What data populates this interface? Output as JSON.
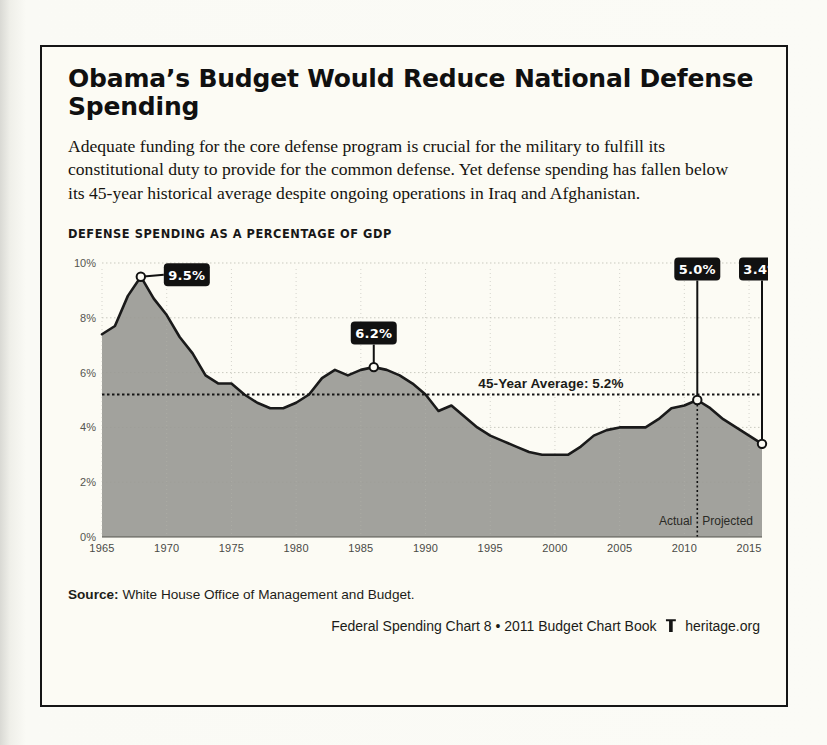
{
  "card": {
    "title": "Obama’s Budget Would Reduce National Defense Spending",
    "blurb": "Adequate funding for the core defense program is crucial for the military to fulfill its constitutional duty to provide for the common defense. Yet defense spending has fallen below its 45-year historical average despite ongoing operations in Iraq and Afghanistan.",
    "source_label": "Source:",
    "source_text": "White House Office of Management and Budget.",
    "footer_left": "Federal Spending Chart 8 • 2011 Budget Chart Book",
    "footer_logo": "heritage-logo-icon",
    "footer_right": "heritage.org"
  },
  "chart_data": {
    "type": "area",
    "title": "DEFENSE SPENDING AS A PERCENTAGE OF GDP",
    "xlabel": "",
    "ylabel": "",
    "xlim": [
      1965,
      2016
    ],
    "ylim": [
      0,
      10
    ],
    "grid": true,
    "legend": null,
    "yticks": [
      0,
      2,
      4,
      6,
      8,
      10
    ],
    "ytick_labels": [
      "0%",
      "2%",
      "4%",
      "6%",
      "8%",
      "10%"
    ],
    "xticks": [
      1965,
      1970,
      1975,
      1980,
      1985,
      1990,
      1995,
      2000,
      2005,
      2010,
      2015
    ],
    "xtick_labels": [
      "1965",
      "1970",
      "1975",
      "1980",
      "1985",
      "1990",
      "1995",
      "2000",
      "2005",
      "2010",
      "2015"
    ],
    "series": [
      {
        "name": "Defense spending as a percentage of GDP",
        "x": [
          1965,
          1966,
          1967,
          1968,
          1969,
          1970,
          1971,
          1972,
          1973,
          1974,
          1975,
          1976,
          1977,
          1978,
          1979,
          1980,
          1981,
          1982,
          1983,
          1984,
          1985,
          1986,
          1987,
          1988,
          1989,
          1990,
          1991,
          1992,
          1993,
          1994,
          1995,
          1996,
          1997,
          1998,
          1999,
          2000,
          2001,
          2002,
          2003,
          2004,
          2005,
          2006,
          2007,
          2008,
          2009,
          2010,
          2011,
          2012,
          2013,
          2014,
          2015,
          2016
        ],
        "values": [
          7.4,
          7.7,
          8.8,
          9.5,
          8.7,
          8.1,
          7.3,
          6.7,
          5.9,
          5.6,
          5.6,
          5.2,
          4.9,
          4.7,
          4.7,
          4.9,
          5.2,
          5.8,
          6.1,
          5.9,
          6.1,
          6.2,
          6.1,
          5.9,
          5.6,
          5.2,
          4.6,
          4.8,
          4.4,
          4.0,
          3.7,
          3.5,
          3.3,
          3.1,
          3.0,
          3.0,
          3.0,
          3.3,
          3.7,
          3.9,
          4.0,
          4.0,
          4.0,
          4.3,
          4.7,
          4.8,
          5.0,
          4.7,
          4.3,
          4.0,
          3.7,
          3.4
        ]
      }
    ],
    "annotations": [
      {
        "name": "peak-callout",
        "label": "9.5%",
        "x": 1968,
        "y": 9.5,
        "placement": "right"
      },
      {
        "name": "reagan-callout",
        "label": "6.2%",
        "x": 1986,
        "y": 6.2,
        "placement": "above"
      },
      {
        "name": "actual-callout",
        "label": "5.0%",
        "x": 2011,
        "y": 5.0,
        "placement": "above-far"
      },
      {
        "name": "projected-callout",
        "label": "3.4%",
        "x": 2016,
        "y": 3.4,
        "placement": "above-far"
      }
    ],
    "average_line": {
      "label": "45-Year Average: 5.2%",
      "value": 5.2
    },
    "divider": {
      "x": 2011,
      "left_label": "Actual",
      "right_label": "Projected"
    },
    "colors": {
      "area_fill": "#9a9a95",
      "line": "#1a1a1a",
      "badge": "#111111",
      "badge_text": "#ffffff",
      "grid": "#c9c9bf",
      "background": "#fcfbf4"
    }
  }
}
